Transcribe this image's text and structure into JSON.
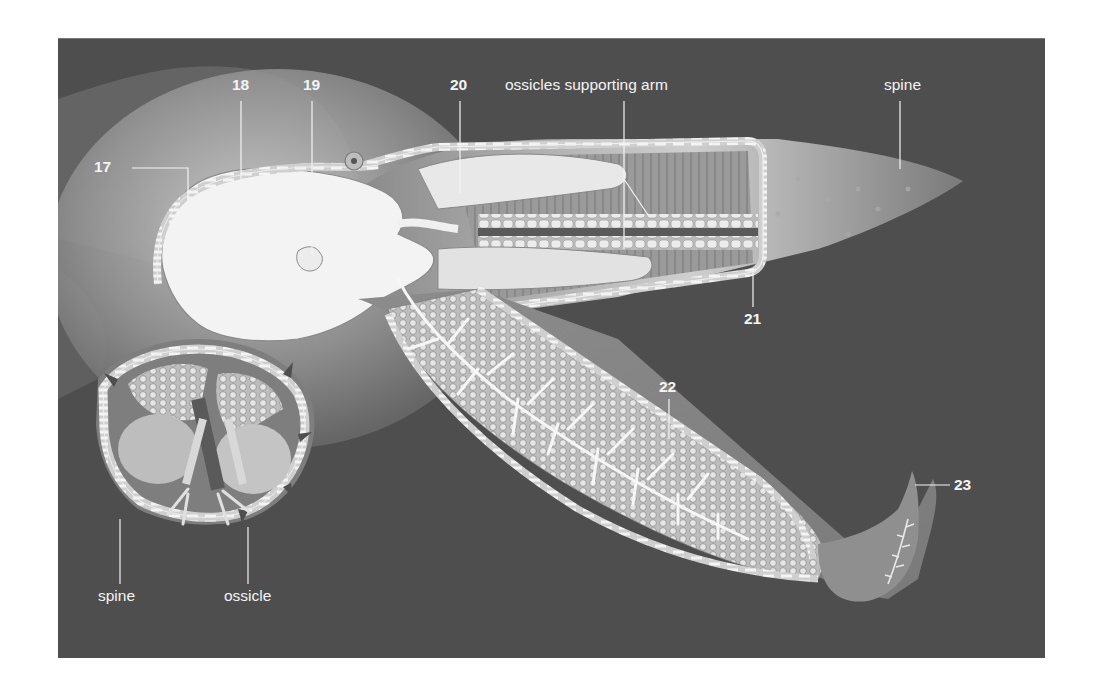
{
  "figure": {
    "background_color": "#4e4e4e",
    "line_color": "#f0f0f0"
  },
  "labels": {
    "n17": "17",
    "n18": "18",
    "n19": "19",
    "n20": "20",
    "n21": "21",
    "n22": "22",
    "n23": "23",
    "ossicles_arm": "ossicles supporting arm",
    "spine_top": "spine",
    "spine_bottom": "spine",
    "ossicle": "ossicle"
  }
}
